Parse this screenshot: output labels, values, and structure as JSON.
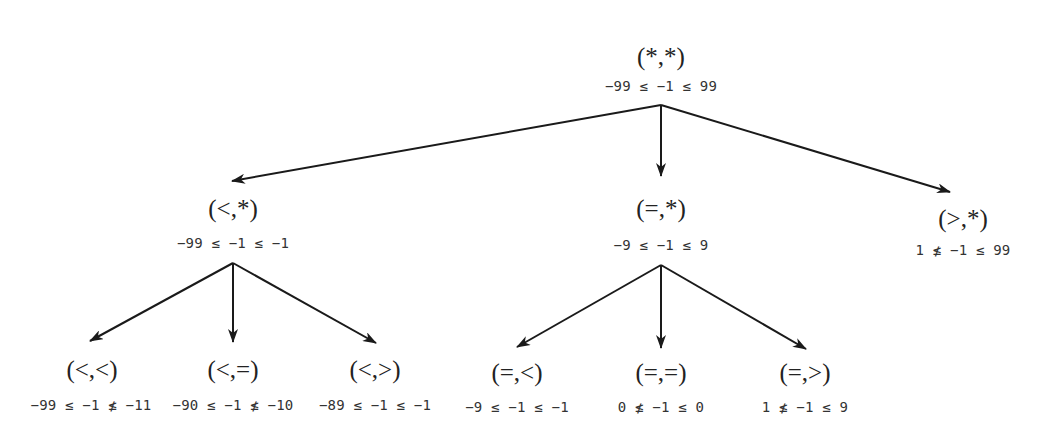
{
  "diagram": {
    "type": "tree",
    "nodes": [
      {
        "id": "root",
        "label": "(*,*)",
        "constraint": "−99 ≤ −1 ≤ 99"
      },
      {
        "id": "lt_star",
        "label": "(<,*)",
        "constraint": "−99 ≤ −1 ≤ −1",
        "parent": "root"
      },
      {
        "id": "eq_star",
        "label": "(=,*)",
        "constraint": "−9 ≤ −1 ≤ 9",
        "parent": "root"
      },
      {
        "id": "gt_star",
        "label": "(>,*)",
        "constraint": "1 ≰ −1 ≤ 99",
        "parent": "root"
      },
      {
        "id": "lt_lt",
        "label": "(<,<)",
        "constraint": "−99 ≤ −1 ≰ −11",
        "parent": "lt_star"
      },
      {
        "id": "lt_eq",
        "label": "(<,=)",
        "constraint": "−90 ≤ −1 ≰ −10",
        "parent": "lt_star"
      },
      {
        "id": "lt_gt",
        "label": "(<,>)",
        "constraint": "−89 ≤ −1 ≤ −1",
        "parent": "lt_star"
      },
      {
        "id": "eq_lt",
        "label": "(=,<)",
        "constraint": "−9 ≤ −1 ≤ −1",
        "parent": "eq_star"
      },
      {
        "id": "eq_eq",
        "label": "(=,=)",
        "constraint": "0 ≰ −1 ≤ 0",
        "parent": "eq_star"
      },
      {
        "id": "eq_gt",
        "label": "(=,>)",
        "constraint": "1 ≰ −1 ≤ 9",
        "parent": "eq_star"
      }
    ],
    "edges": [
      {
        "from": "root",
        "to": "lt_star"
      },
      {
        "from": "root",
        "to": "eq_star"
      },
      {
        "from": "root",
        "to": "gt_star"
      },
      {
        "from": "lt_star",
        "to": "lt_lt"
      },
      {
        "from": "lt_star",
        "to": "lt_eq"
      },
      {
        "from": "lt_star",
        "to": "lt_gt"
      },
      {
        "from": "eq_star",
        "to": "eq_lt"
      },
      {
        "from": "eq_star",
        "to": "eq_eq"
      },
      {
        "from": "eq_star",
        "to": "eq_gt"
      }
    ]
  }
}
